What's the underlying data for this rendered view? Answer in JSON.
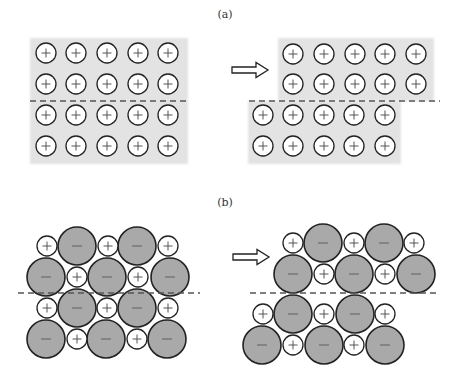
{
  "figure": {
    "panels": [
      {
        "id": "a",
        "label": "(a)",
        "label_pos": [
          225,
          18
        ],
        "description": "Metal: layers of positive ions in electron sea; shifting a layer keeps like neighbours, so no repulsion",
        "left": {
          "blocks": [
            {
              "x": 30,
              "y": 38,
              "w": 158,
              "h": 126
            }
          ],
          "ions": {
            "charge": "+",
            "radius": 10,
            "xs": [
              46,
              76,
              107,
              138,
              168
            ],
            "ys": [
              53,
              84,
              115,
              146
            ]
          },
          "slip_line": {
            "x1": 30,
            "x2": 188,
            "y": 101
          }
        },
        "arrow": {
          "x": 232,
          "y": 70
        },
        "right": {
          "blocks": [
            {
              "x": 278,
              "y": 38,
              "w": 156,
              "h": 63
            },
            {
              "x": 248,
              "y": 101,
              "w": 153,
              "h": 63
            }
          ],
          "ion_groups": [
            {
              "charge": "+",
              "radius": 10,
              "xs": [
                293,
                324,
                355,
                385,
                416
              ],
              "ys": [
                54,
                84
              ]
            },
            {
              "charge": "+",
              "radius": 10,
              "xs": [
                263,
                293,
                324,
                354,
                385
              ],
              "ys": [
                115,
                146
              ]
            }
          ],
          "slip_line": {
            "x1": 249,
            "x2": 440,
            "y": 101
          }
        }
      },
      {
        "id": "b",
        "label": "(b)",
        "label_pos": [
          225,
          206
        ],
        "description": "Ionic crystal: shifting a layer brings like charges together, causing repulsion",
        "left": {
          "rows": [
            {
              "y": 246,
              "ions": [
                [
                  "+",
                  47
                ],
                [
                  "-",
                  77
                ],
                [
                  "+",
                  108
                ],
                [
                  "-",
                  137
                ],
                [
                  "+",
                  168
                ]
              ]
            },
            {
              "y": 277,
              "ions": [
                [
                  "-",
                  46
                ],
                [
                  "+",
                  77
                ],
                [
                  "-",
                  107
                ],
                [
                  "+",
                  138
                ],
                [
                  "-",
                  170
                ]
              ]
            },
            {
              "y": 308,
              "ions": [
                [
                  "+",
                  47
                ],
                [
                  "-",
                  77
                ],
                [
                  "+",
                  107
                ],
                [
                  "-",
                  137
                ],
                [
                  "+",
                  168
                ]
              ]
            },
            {
              "y": 339,
              "ions": [
                [
                  "-",
                  46
                ],
                [
                  "+",
                  77
                ],
                [
                  "-",
                  106
                ],
                [
                  "+",
                  137
                ],
                [
                  "-",
                  167
                ]
              ]
            }
          ],
          "slip_line": {
            "x1": 18,
            "x2": 200,
            "y": 293
          }
        },
        "arrow": {
          "x": 233,
          "y": 257
        },
        "right": {
          "rows": [
            {
              "y": 243,
              "ions": [
                [
                  "+",
                  293
                ],
                [
                  "-",
                  323
                ],
                [
                  "+",
                  354
                ],
                [
                  "-",
                  384
                ],
                [
                  "+",
                  414
                ]
              ]
            },
            {
              "y": 274,
              "ions": [
                [
                  "-",
                  293
                ],
                [
                  "+",
                  324
                ],
                [
                  "-",
                  354
                ],
                [
                  "+",
                  385
                ],
                [
                  "-",
                  416
                ]
              ]
            },
            {
              "y": 314,
              "ions": [
                [
                  "+",
                  263
                ],
                [
                  "-",
                  293
                ],
                [
                  "+",
                  324
                ],
                [
                  "-",
                  355
                ],
                [
                  "+",
                  385
                ]
              ]
            },
            {
              "y": 345,
              "ions": [
                [
                  "-",
                  262
                ],
                [
                  "+",
                  293
                ],
                [
                  "-",
                  324
                ],
                [
                  "+",
                  354
                ],
                [
                  "-",
                  385
                ]
              ]
            }
          ],
          "slip_line": {
            "x1": 250,
            "x2": 437,
            "y": 293
          }
        }
      }
    ],
    "symbols": {
      "cation": "+",
      "anion": "−"
    },
    "radii": {
      "cation": 10,
      "anion": 19
    },
    "colors": {
      "block_bg": "#e3e3e3",
      "cation_fill": "#ffffff",
      "anion_fill": "#a9a9a9",
      "outline": "#222222",
      "dash": "#555555"
    }
  }
}
